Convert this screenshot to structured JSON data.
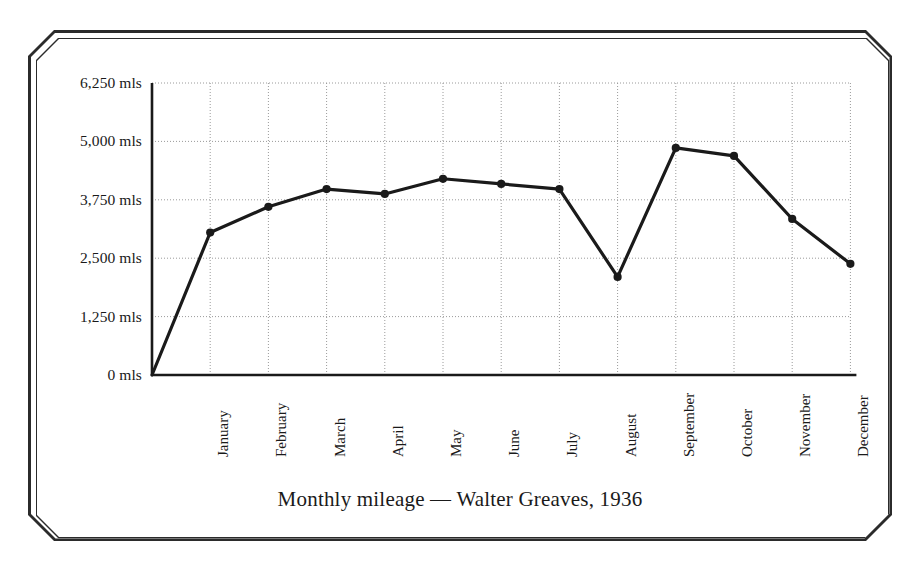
{
  "chart_data": {
    "type": "line",
    "title": "Monthly mileage — Walter Greaves, 1936",
    "xlabel": "",
    "ylabel": "",
    "grid": true,
    "legend": "none",
    "unit_suffix": "mls",
    "categories": [
      "January",
      "February",
      "March",
      "April",
      "May",
      "June",
      "July",
      "August",
      "September",
      "October",
      "November",
      "December"
    ],
    "values": [
      3050,
      3600,
      3980,
      3875,
      4200,
      4090,
      3980,
      2100,
      4860,
      4690,
      3340,
      2380
    ],
    "origin_value": 0,
    "ylim": [
      0,
      6250
    ],
    "yticks": [
      0,
      1250,
      2500,
      3750,
      5000,
      6250
    ],
    "ytick_labels": [
      "0 mls",
      "1,250 mls",
      "2,500 mls",
      "3,750 mls",
      "5,000 mls",
      "6,250 mls"
    ],
    "line_color": "#1a1a1a",
    "marker_color": "#1a1a1a",
    "grid_color": "#9a9a9a",
    "axis_color": "#1a1a1a",
    "frame_color": "#2b2b2b"
  },
  "figure": {
    "caption": "Monthly mileage — Walter Greaves, 1936"
  }
}
